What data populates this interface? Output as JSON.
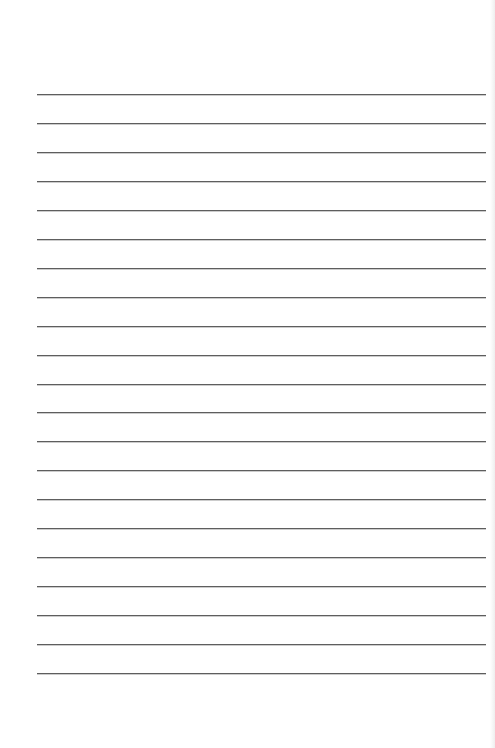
{
  "page": {
    "type": "lined-paper",
    "background_color": "#ffffff",
    "line_color": "#5e5e5e",
    "line_count": 21,
    "line_spacing_px": 28.95,
    "first_line_top_px": 94,
    "line_left_px": 37,
    "line_width_px": 449
  }
}
